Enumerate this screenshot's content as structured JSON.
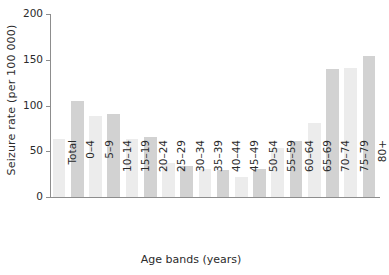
{
  "chart_data": {
    "type": "bar",
    "title": "",
    "xlabel": "Age bands (years)",
    "ylabel": "Seizure rate (per 100 000)",
    "ylim": [
      0,
      200
    ],
    "yticks": [
      0,
      50,
      100,
      150,
      200
    ],
    "ytick_labels": [
      "0",
      "50",
      "100",
      "150",
      "200"
    ],
    "grid": false,
    "legend": "none",
    "categories": [
      "Total",
      "0–4",
      "5–9",
      "10–14",
      "15–19",
      "20–24",
      "25–29",
      "30–34",
      "35–39",
      "40–44",
      "45–49",
      "50–54",
      "55–59",
      "60–64",
      "65–69",
      "70–74",
      "75–79",
      "80+"
    ],
    "values": [
      63,
      105,
      88,
      91,
      63,
      66,
      37,
      34,
      31,
      30,
      22,
      31,
      54,
      61,
      81,
      140,
      141,
      154
    ],
    "bar_colors": [
      "#ececec",
      "#d2d2d2",
      "#ececec",
      "#d2d2d2",
      "#ececec",
      "#d2d2d2",
      "#ececec",
      "#d2d2d2",
      "#ececec",
      "#d2d2d2",
      "#ececec",
      "#d2d2d2",
      "#ececec",
      "#d2d2d2",
      "#ececec",
      "#d2d2d2",
      "#ececec",
      "#d2d2d2"
    ],
    "axis_color": "#8d8d8d",
    "text_color": "#2b2b2b",
    "background": "#ffffff"
  }
}
